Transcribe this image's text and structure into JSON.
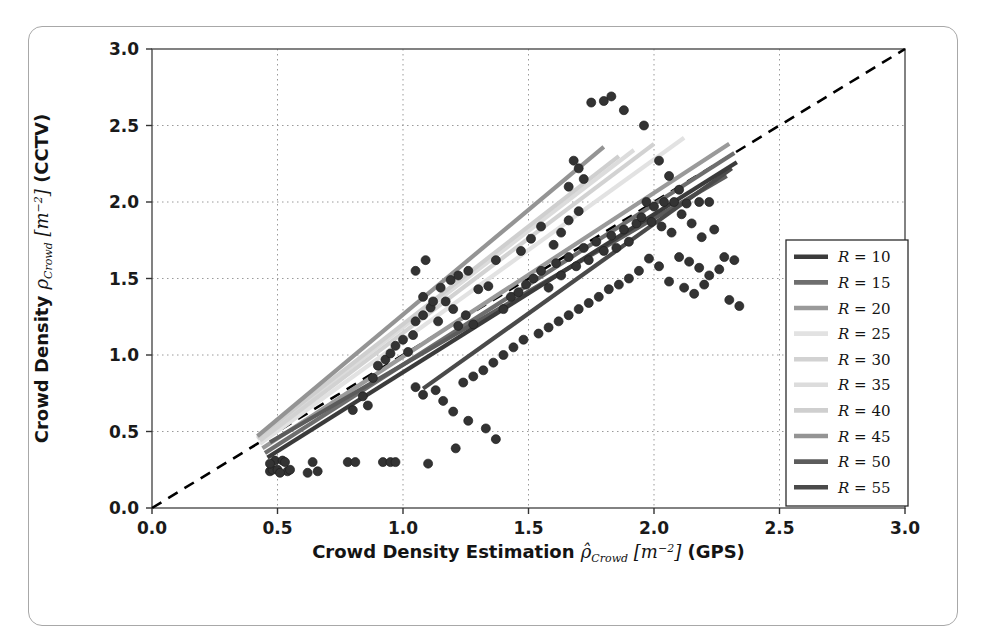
{
  "figure": {
    "frame_border_color": "#a8a8a8",
    "background": "#ffffff"
  },
  "axes": {
    "x_title_main": "Crowd Density Estimation",
    "x_title_symbol": "ρ̂",
    "x_title_sub": "Crowd",
    "x_title_units": "[m",
    "x_title_units_exp": "−2",
    "x_title_units_close": "]",
    "x_title_source": "(GPS)",
    "y_title_main": "Crowd Density",
    "y_title_symbol": "ρ",
    "y_title_sub": "Crowd",
    "y_title_units": "[m",
    "y_title_units_exp": "−2",
    "y_title_units_close": "]",
    "y_title_source": "(CCTV)",
    "x_ticks": [
      "0.0",
      "0.5",
      "1.0",
      "1.5",
      "2.0",
      "2.5",
      "3.0"
    ],
    "y_ticks": [
      "0.0",
      "0.5",
      "1.0",
      "1.5",
      "2.0",
      "2.5",
      "3.0"
    ]
  },
  "legend": {
    "entries": [
      {
        "label_r": "R",
        "label_eq": "=",
        "label_val": "10",
        "color": "#3b3b3b"
      },
      {
        "label_r": "R",
        "label_eq": "=",
        "label_val": "15",
        "color": "#6e6e6e"
      },
      {
        "label_r": "R",
        "label_eq": "=",
        "label_val": "20",
        "color": "#9a9a9a"
      },
      {
        "label_r": "R",
        "label_eq": "=",
        "label_val": "25",
        "color": "#e2e2e2"
      },
      {
        "label_r": "R",
        "label_eq": "=",
        "label_val": "30",
        "color": "#d2d2d2"
      },
      {
        "label_r": "R",
        "label_eq": "=",
        "label_val": "35",
        "color": "#dcdcdc"
      },
      {
        "label_r": "R",
        "label_eq": "=",
        "label_val": "40",
        "color": "#cfcfcf"
      },
      {
        "label_r": "R",
        "label_eq": "=",
        "label_val": "45",
        "color": "#949494"
      },
      {
        "label_r": "R",
        "label_eq": "=",
        "label_val": "50",
        "color": "#5c5c5c"
      },
      {
        "label_r": "R",
        "label_eq": "=",
        "label_val": "55",
        "color": "#4a4a4a"
      }
    ]
  },
  "chart_data": {
    "type": "scatter",
    "title": "",
    "xlabel": "Crowd Density Estimation ρ̂_Crowd [m^-2] (GPS)",
    "ylabel": "Crowd Density ρ_Crowd [m^-2] (CCTV)",
    "xlim": [
      0.0,
      3.0
    ],
    "ylim": [
      0.0,
      3.0
    ],
    "grid": true,
    "grid_style": "dotted",
    "legend_position": "right",
    "marker": {
      "shape": "circle",
      "color": "#333333",
      "size": 9
    },
    "identity_line": {
      "label": "y = x",
      "style": "dashed",
      "color": "#000000",
      "from": [
        0.0,
        0.0
      ],
      "to": [
        3.0,
        3.0
      ]
    },
    "regression_lines": [
      {
        "name": "R=10",
        "color": "#3b3b3b",
        "x_from": 0.46,
        "y_from": 0.33,
        "x_to": 2.33,
        "y_to": 2.26
      },
      {
        "name": "R=15",
        "color": "#6e6e6e",
        "x_from": 0.45,
        "y_from": 0.36,
        "x_to": 2.32,
        "y_to": 2.32
      },
      {
        "name": "R=20",
        "color": "#9a9a9a",
        "x_from": 0.44,
        "y_from": 0.39,
        "x_to": 2.3,
        "y_to": 2.38
      },
      {
        "name": "R=25",
        "color": "#e2e2e2",
        "x_from": 0.43,
        "y_from": 0.42,
        "x_to": 2.12,
        "y_to": 2.42
      },
      {
        "name": "R=30",
        "color": "#d2d2d2",
        "x_from": 0.43,
        "y_from": 0.44,
        "x_to": 2.0,
        "y_to": 2.38
      },
      {
        "name": "R=35",
        "color": "#dcdcdc",
        "x_from": 0.42,
        "y_from": 0.45,
        "x_to": 1.92,
        "y_to": 2.34
      },
      {
        "name": "R=40",
        "color": "#cfcfcf",
        "x_from": 0.42,
        "y_from": 0.46,
        "x_to": 1.86,
        "y_to": 2.3
      },
      {
        "name": "R=45",
        "color": "#949494",
        "x_from": 0.42,
        "y_from": 0.47,
        "x_to": 1.8,
        "y_to": 2.36
      },
      {
        "name": "R=50",
        "color": "#5c5c5c",
        "x_from": 0.47,
        "y_from": 0.43,
        "x_to": 2.29,
        "y_to": 2.17
      },
      {
        "name": "R=55",
        "color": "#4a4a4a",
        "x_from": 1.08,
        "y_from": 0.78,
        "x_to": 2.31,
        "y_to": 2.22
      }
    ],
    "points": [
      [
        0.47,
        0.24
      ],
      [
        0.48,
        0.25
      ],
      [
        0.5,
        0.25
      ],
      [
        0.49,
        0.31
      ],
      [
        0.52,
        0.31
      ],
      [
        0.54,
        0.24
      ],
      [
        0.55,
        0.25
      ],
      [
        0.47,
        0.29
      ],
      [
        0.51,
        0.23
      ],
      [
        0.53,
        0.3
      ],
      [
        0.62,
        0.23
      ],
      [
        0.64,
        0.3
      ],
      [
        0.66,
        0.24
      ],
      [
        0.78,
        0.3
      ],
      [
        0.81,
        0.3
      ],
      [
        0.92,
        0.3
      ],
      [
        0.95,
        0.3
      ],
      [
        0.97,
        0.3
      ],
      [
        1.1,
        0.29
      ],
      [
        1.21,
        0.39
      ],
      [
        1.37,
        0.45
      ],
      [
        1.33,
        0.52
      ],
      [
        1.26,
        0.57
      ],
      [
        1.2,
        0.63
      ],
      [
        1.08,
        0.74
      ],
      [
        1.13,
        0.77
      ],
      [
        1.16,
        0.7
      ],
      [
        1.05,
        0.79
      ],
      [
        0.88,
        0.85
      ],
      [
        0.9,
        0.93
      ],
      [
        0.93,
        0.97
      ],
      [
        0.95,
        1.01
      ],
      [
        0.97,
        1.06
      ],
      [
        1.0,
        1.1
      ],
      [
        1.02,
        1.02
      ],
      [
        1.04,
        1.13
      ],
      [
        0.84,
        0.73
      ],
      [
        0.86,
        0.67
      ],
      [
        0.8,
        0.64
      ],
      [
        1.05,
        1.22
      ],
      [
        1.08,
        1.26
      ],
      [
        1.11,
        1.31
      ],
      [
        1.14,
        1.22
      ],
      [
        1.17,
        1.35
      ],
      [
        1.2,
        1.3
      ],
      [
        1.22,
        1.19
      ],
      [
        1.25,
        1.26
      ],
      [
        1.28,
        1.2
      ],
      [
        1.3,
        1.43
      ],
      [
        1.34,
        1.45
      ],
      [
        1.37,
        1.62
      ],
      [
        1.19,
        1.49
      ],
      [
        1.22,
        1.52
      ],
      [
        1.26,
        1.55
      ],
      [
        1.15,
        1.44
      ],
      [
        1.08,
        1.38
      ],
      [
        1.12,
        1.35
      ],
      [
        1.4,
        1.3
      ],
      [
        1.43,
        1.38
      ],
      [
        1.46,
        1.41
      ],
      [
        1.49,
        1.46
      ],
      [
        1.52,
        1.5
      ],
      [
        1.55,
        1.55
      ],
      [
        1.58,
        1.44
      ],
      [
        1.61,
        1.6
      ],
      [
        1.63,
        1.52
      ],
      [
        1.66,
        1.64
      ],
      [
        1.69,
        1.58
      ],
      [
        1.72,
        1.7
      ],
      [
        1.74,
        1.62
      ],
      [
        1.77,
        1.74
      ],
      [
        1.8,
        1.68
      ],
      [
        1.83,
        1.78
      ],
      [
        1.85,
        1.7
      ],
      [
        1.88,
        1.82
      ],
      [
        1.9,
        1.74
      ],
      [
        1.93,
        1.86
      ],
      [
        1.6,
        1.72
      ],
      [
        1.63,
        1.8
      ],
      [
        1.66,
        1.88
      ],
      [
        1.7,
        1.94
      ],
      [
        1.55,
        1.84
      ],
      [
        1.51,
        1.76
      ],
      [
        1.47,
        1.68
      ],
      [
        1.75,
        2.65
      ],
      [
        1.8,
        2.66
      ],
      [
        1.83,
        2.69
      ],
      [
        1.88,
        2.6
      ],
      [
        1.96,
        2.5
      ],
      [
        1.68,
        2.27
      ],
      [
        1.7,
        2.22
      ],
      [
        1.72,
        2.15
      ],
      [
        1.66,
        2.1
      ],
      [
        2.02,
        2.27
      ],
      [
        2.06,
        2.17
      ],
      [
        2.1,
        2.08
      ],
      [
        1.97,
        2.0
      ],
      [
        2.0,
        1.97
      ],
      [
        2.04,
        2.0
      ],
      [
        2.08,
        2.0
      ],
      [
        2.13,
        1.99
      ],
      [
        2.18,
        2.0
      ],
      [
        2.22,
        2.0
      ],
      [
        1.95,
        1.9
      ],
      [
        1.99,
        1.87
      ],
      [
        2.03,
        1.84
      ],
      [
        2.07,
        1.8
      ],
      [
        2.11,
        1.92
      ],
      [
        2.15,
        1.86
      ],
      [
        2.19,
        1.77
      ],
      [
        2.24,
        1.82
      ],
      [
        2.28,
        1.64
      ],
      [
        2.32,
        1.62
      ],
      [
        2.26,
        1.56
      ],
      [
        2.1,
        1.64
      ],
      [
        2.14,
        1.61
      ],
      [
        2.18,
        1.57
      ],
      [
        2.22,
        1.52
      ],
      [
        1.98,
        1.63
      ],
      [
        2.02,
        1.58
      ],
      [
        1.94,
        1.55
      ],
      [
        1.9,
        1.5
      ],
      [
        1.86,
        1.46
      ],
      [
        1.82,
        1.43
      ],
      [
        2.06,
        1.48
      ],
      [
        2.12,
        1.44
      ],
      [
        2.16,
        1.4
      ],
      [
        2.2,
        1.46
      ],
      [
        1.78,
        1.38
      ],
      [
        1.74,
        1.34
      ],
      [
        1.7,
        1.3
      ],
      [
        1.66,
        1.26
      ],
      [
        1.62,
        1.22
      ],
      [
        1.58,
        1.18
      ],
      [
        1.54,
        1.14
      ],
      [
        1.44,
        1.05
      ],
      [
        1.48,
        1.1
      ],
      [
        1.4,
        1.0
      ],
      [
        1.36,
        0.95
      ],
      [
        1.32,
        0.9
      ],
      [
        1.28,
        0.86
      ],
      [
        1.24,
        0.82
      ],
      [
        2.3,
        1.36
      ],
      [
        2.34,
        1.32
      ],
      [
        1.09,
        1.62
      ],
      [
        1.05,
        1.55
      ]
    ]
  }
}
